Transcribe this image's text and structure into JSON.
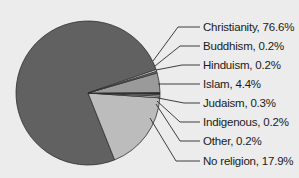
{
  "chart_data": {
    "type": "pie",
    "title": "",
    "categories": [
      "Christianity",
      "Buddhism",
      "Hinduism",
      "Islam",
      "Judaism",
      "Indigenous",
      "Other",
      "No religion"
    ],
    "values": [
      76.6,
      0.2,
      0.2,
      4.4,
      0.3,
      0.2,
      0.2,
      17.9
    ],
    "unit": "%",
    "labels": [
      "Christianity, 76.6%",
      "Buddhism, 0.2%",
      "Hinduism, 0.2%",
      "Islam, 4.4%",
      "Judaism, 0.3%",
      "Indigenous, 0.2%",
      "Other, 0.2%",
      "No religion, 17.9%"
    ],
    "colors": [
      "#616161",
      "#d8d8d8",
      "#7a7a7a",
      "#9a9a9a",
      "#2a2a2a",
      "#bdbdbd",
      "#e6e6e6",
      "#bcbcbc"
    ],
    "legend_position": "right (callout labels with leader lines)",
    "grid": false
  }
}
